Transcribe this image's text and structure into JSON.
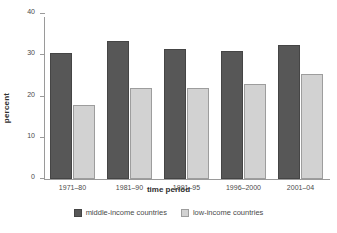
{
  "chart_data": {
    "type": "bar",
    "title": "",
    "xlabel": "time period",
    "ylabel": "percent",
    "categories": [
      "1971–80",
      "1981–90",
      "1991–95",
      "1996–2000",
      "2001–04"
    ],
    "series": [
      {
        "name": "middle-income countries",
        "color": "#575757",
        "values": [
          30.5,
          33.5,
          31.5,
          31.0,
          32.5
        ]
      },
      {
        "name": "low-income countries",
        "color": "#d2d2d2",
        "values": [
          18.0,
          22.0,
          22.0,
          23.0,
          25.5
        ]
      }
    ],
    "ylim": [
      0,
      40
    ],
    "yticks": [
      0,
      10,
      20,
      30,
      40
    ],
    "ytick_labels": [
      "0",
      "10",
      "20",
      "30",
      "40"
    ],
    "grid": false,
    "legend_position": "bottom"
  },
  "axes": {
    "ylabel": "percent",
    "xlabel": "time period"
  },
  "legend": {
    "items": [
      {
        "label": "middle-income countries",
        "swatch": "dark-swatch"
      },
      {
        "label": "low-income countries",
        "swatch": "light-swatch"
      }
    ]
  }
}
